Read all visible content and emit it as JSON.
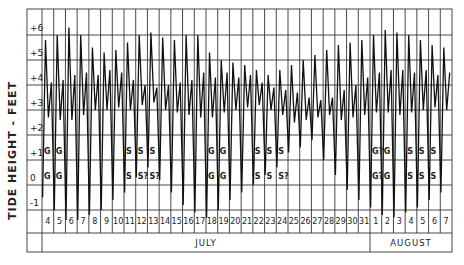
{
  "chart_data": {
    "type": "line",
    "title": "",
    "ylabel": "TIDE HEIGHT - FEET",
    "xlabel": "",
    "ylim": [
      -1.8,
      7
    ],
    "grid": true,
    "yticks": [
      "+6",
      "+5",
      "+4",
      "+3",
      "+2",
      "+1",
      "0",
      "-1"
    ],
    "ytick_values": [
      6,
      5,
      4,
      3,
      2,
      1,
      0,
      -1
    ],
    "x_days": [
      "4",
      "5",
      "6",
      "7",
      "8",
      "9",
      "10",
      "11",
      "12",
      "13",
      "14",
      "15",
      "16",
      "17",
      "18",
      "19",
      "20",
      "21",
      "22",
      "23",
      "24",
      "25",
      "26",
      "27",
      "28",
      "29",
      "30",
      "31",
      "1",
      "2",
      "3",
      "4",
      "5",
      "6",
      "7"
    ],
    "months": [
      {
        "label": "JULY",
        "start_index": 0,
        "span": 28
      },
      {
        "label": "AUGUST",
        "start_index": 28,
        "span": 7
      }
    ],
    "series": [
      {
        "name": "Tide height",
        "note": "Two high and two low tides per day; values approximate daily extremes (higher high, lower high, higher low, lower low) in feet",
        "daily_extremes": [
          {
            "day": "Jul 4",
            "hh": 5.8,
            "lh": 4.1,
            "hl": 2.7,
            "ll": -0.5
          },
          {
            "day": "Jul 5",
            "hh": 6.0,
            "lh": 4.2,
            "hl": 2.6,
            "ll": -1.0
          },
          {
            "day": "Jul 6",
            "hh": 6.3,
            "lh": 4.4,
            "hl": 2.6,
            "ll": -1.4
          },
          {
            "day": "Jul 7",
            "hh": 6.0,
            "lh": 4.5,
            "hl": 2.8,
            "ll": -1.4
          },
          {
            "day": "Jul 8",
            "hh": 5.5,
            "lh": 4.4,
            "hl": 3.0,
            "ll": -1.2
          },
          {
            "day": "Jul 9",
            "hh": 5.3,
            "lh": 4.6,
            "hl": 3.0,
            "ll": -1.0
          },
          {
            "day": "Jul 10",
            "hh": 5.4,
            "lh": 4.5,
            "hl": 3.1,
            "ll": -0.6
          },
          {
            "day": "Jul 11",
            "hh": 5.7,
            "lh": 4.2,
            "hl": 3.0,
            "ll": -0.3
          },
          {
            "day": "Jul 12",
            "hh": 6.0,
            "lh": 4.0,
            "hl": 3.2,
            "ll": 0.3
          },
          {
            "day": "Jul 13",
            "hh": 6.1,
            "lh": 3.9,
            "hl": 3.3,
            "ll": 0.7
          },
          {
            "day": "Jul 14",
            "hh": 5.9,
            "lh": 4.0,
            "hl": 3.0,
            "ll": 0.2
          },
          {
            "day": "Jul 15",
            "hh": 5.8,
            "lh": 4.1,
            "hl": 2.9,
            "ll": -0.3
          },
          {
            "day": "Jul 16",
            "hh": 6.0,
            "lh": 4.2,
            "hl": 2.8,
            "ll": -0.8
          },
          {
            "day": "Jul 17",
            "hh": 6.0,
            "lh": 4.5,
            "hl": 2.7,
            "ll": -1.1
          },
          {
            "day": "Jul 18",
            "hh": 5.3,
            "lh": 4.3,
            "hl": 2.7,
            "ll": -1.3
          },
          {
            "day": "Jul 19",
            "hh": 5.0,
            "lh": 4.5,
            "hl": 2.9,
            "ll": -1.0
          },
          {
            "day": "Jul 20",
            "hh": 4.9,
            "lh": 4.3,
            "hl": 3.0,
            "ll": -0.6
          },
          {
            "day": "Jul 21",
            "hh": 4.8,
            "lh": 4.4,
            "hl": 3.1,
            "ll": -0.3
          },
          {
            "day": "Jul 22",
            "hh": 4.6,
            "lh": 4.1,
            "hl": 3.2,
            "ll": 0.0
          },
          {
            "day": "Jul 23",
            "hh": 4.4,
            "lh": 3.9,
            "hl": 3.0,
            "ll": 0.4
          },
          {
            "day": "Jul 24",
            "hh": 4.6,
            "lh": 3.8,
            "hl": 2.8,
            "ll": 0.7
          },
          {
            "day": "Jul 25",
            "hh": 4.8,
            "lh": 3.7,
            "hl": 2.5,
            "ll": 1.3
          },
          {
            "day": "Jul 26",
            "hh": 5.0,
            "lh": 3.5,
            "hl": 2.6,
            "ll": 1.5
          },
          {
            "day": "Jul 27",
            "hh": 5.2,
            "lh": 3.4,
            "hl": 2.7,
            "ll": 1.8
          },
          {
            "day": "Jul 28",
            "hh": 5.4,
            "lh": 3.5,
            "hl": 2.8,
            "ll": 1.0
          },
          {
            "day": "Jul 29",
            "hh": 5.6,
            "lh": 3.8,
            "hl": 2.6,
            "ll": 0.4
          },
          {
            "day": "Jul 30",
            "hh": 5.7,
            "lh": 4.0,
            "hl": 2.7,
            "ll": -0.2
          },
          {
            "day": "Jul 31",
            "hh": 5.8,
            "lh": 4.3,
            "hl": 2.8,
            "ll": -0.6
          },
          {
            "day": "Aug 1",
            "hh": 6.0,
            "lh": 4.5,
            "hl": 2.9,
            "ll": -0.9
          },
          {
            "day": "Aug 2",
            "hh": 6.2,
            "lh": 4.6,
            "hl": 2.9,
            "ll": -1.2
          },
          {
            "day": "Aug 3",
            "hh": 6.1,
            "lh": 4.6,
            "hl": 2.8,
            "ll": -1.3
          },
          {
            "day": "Aug 4",
            "hh": 6.0,
            "lh": 4.5,
            "hl": 2.9,
            "ll": -1.1
          },
          {
            "day": "Aug 5",
            "hh": 5.8,
            "lh": 4.6,
            "hl": 3.0,
            "ll": -0.9
          },
          {
            "day": "Aug 6",
            "hh": 5.6,
            "lh": 4.4,
            "hl": 3.1,
            "ll": -0.6
          },
          {
            "day": "Aug 7",
            "hh": 5.5,
            "lh": 4.5,
            "hl": 3.0,
            "ll": -0.3
          }
        ]
      }
    ],
    "annotations": [
      {
        "text": "G",
        "day_index": 0,
        "level": 1
      },
      {
        "text": "G",
        "day_index": 1,
        "level": 1
      },
      {
        "text": "G",
        "day_index": 0,
        "level": 0
      },
      {
        "text": "G",
        "day_index": 1,
        "level": 0
      },
      {
        "text": "S",
        "day_index": 7,
        "level": 1
      },
      {
        "text": "S",
        "day_index": 8,
        "level": 1
      },
      {
        "text": "S",
        "day_index": 9,
        "level": 1
      },
      {
        "text": "S",
        "day_index": 7,
        "level": 0
      },
      {
        "text": "S?",
        "day_index": 8,
        "level": 0
      },
      {
        "text": "S?",
        "day_index": 9,
        "level": 0
      },
      {
        "text": "G",
        "day_index": 14,
        "level": 1
      },
      {
        "text": "G",
        "day_index": 15,
        "level": 1
      },
      {
        "text": "G",
        "day_index": 14,
        "level": 0
      },
      {
        "text": "G",
        "day_index": 15,
        "level": 0
      },
      {
        "text": "S",
        "day_index": 18,
        "level": 1
      },
      {
        "text": "S",
        "day_index": 19,
        "level": 1
      },
      {
        "text": "S",
        "day_index": 20,
        "level": 1
      },
      {
        "text": "S",
        "day_index": 18,
        "level": 0
      },
      {
        "text": "S",
        "day_index": 19,
        "level": 0
      },
      {
        "text": "S?",
        "day_index": 20,
        "level": 0
      },
      {
        "text": "G?",
        "day_index": 28,
        "level": 1
      },
      {
        "text": "G",
        "day_index": 29,
        "level": 1
      },
      {
        "text": "G?",
        "day_index": 28,
        "level": 0
      },
      {
        "text": "G",
        "day_index": 29,
        "level": 0
      },
      {
        "text": "S",
        "day_index": 31,
        "level": 1
      },
      {
        "text": "S",
        "day_index": 32,
        "level": 1
      },
      {
        "text": "S",
        "day_index": 33,
        "level": 1
      },
      {
        "text": "S",
        "day_index": 31,
        "level": 0
      },
      {
        "text": "S",
        "day_index": 32,
        "level": 0
      },
      {
        "text": "S",
        "day_index": 33,
        "level": 0
      }
    ],
    "colors": {
      "line": "#111111",
      "grid": "#333333",
      "background": "#ffffff",
      "text": "#222222"
    }
  }
}
